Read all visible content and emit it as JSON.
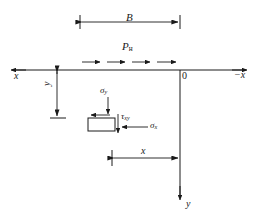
{
  "figure": {
    "background_color": "#ffffff",
    "line_color": "#1a1a1a"
  },
  "labels": {
    "width_B": "B",
    "load_P": "P",
    "load_P_subscript": "н",
    "axis_x_left": "x",
    "origin": "0",
    "axis_x_right_sign": "−",
    "axis_x_right": "x",
    "depth_y": "y",
    "sigma_y": "σ",
    "sigma_y_subscript": "y",
    "tau_xy": "τ",
    "tau_xy_subscript": "xy",
    "sigma_x": "σ",
    "sigma_x_subscript": "x",
    "distance_x": "x",
    "axis_y_down": "y"
  },
  "geometry": {
    "ground_line": {
      "x1": 10,
      "y1": 70,
      "x2": 248,
      "y2": 70
    },
    "vertical_axis": {
      "x1": 180,
      "y1": 70,
      "x2": 180,
      "y2": 200
    },
    "dimension_B": {
      "x1": 80,
      "x2": 180,
      "y": 22
    },
    "load_arrows_y": 62,
    "load_arrows_x": [
      82,
      106,
      131,
      156
    ],
    "load_arrow_length": 18,
    "depth_dimension": {
      "x": 57,
      "y1": 70,
      "y2": 118
    },
    "distance_dimension": {
      "x1": 112,
      "x2": 180,
      "y": 158
    },
    "stress_element": {
      "x": 88,
      "y": 118,
      "width": 27,
      "height": 13
    },
    "sigma_y_arrow": {
      "x": 108,
      "y1": 97,
      "y2": 116
    },
    "sigma_x_arrow": {
      "x1": 148,
      "x2": 121,
      "y": 127
    },
    "tau_xy_arrow": {
      "x": 118,
      "y1": 114,
      "y2": 134
    },
    "shear_top_arrow": {
      "x1": 110,
      "x2": 92,
      "y": 115
    }
  }
}
